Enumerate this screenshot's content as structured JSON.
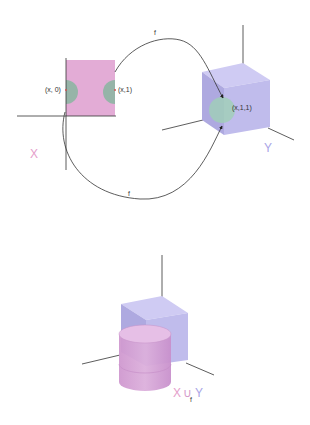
{
  "colors": {
    "square_fill": "#e3acd6",
    "patch_fill": "#96b4a8",
    "cube_front": "#c0bcec",
    "cube_top": "#cfcbf3",
    "cube_side": "#aea9e0",
    "cube_patch": "#9fd0b6",
    "cylinder_fill": "#d5a3d4",
    "axis": "#333333",
    "label_x_color": "#e59ecb",
    "label_y_color": "#a9a5e6"
  },
  "top_diagram": {
    "domain_label": "X",
    "codomain_label": "Y",
    "point_left": "(x, 0)",
    "point_right": "(x,1)",
    "point_image": "(x,1,1)",
    "map_top_label": "f",
    "map_bottom_label": "f"
  },
  "bottom_diagram": {
    "label_x": "X",
    "label_union": "∪",
    "label_sub": "f",
    "label_y": "Y"
  }
}
